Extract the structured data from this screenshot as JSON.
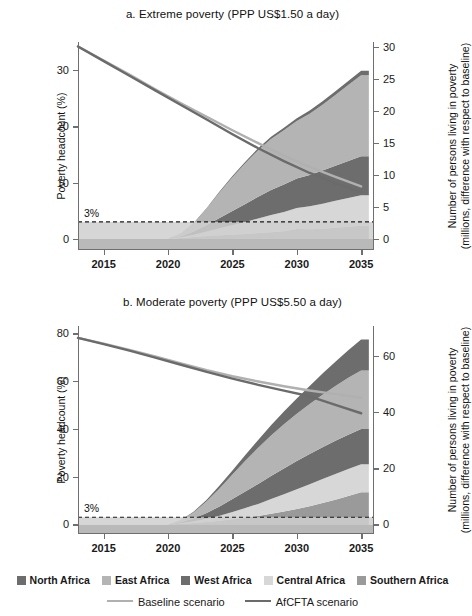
{
  "figure": {
    "threshold_label": "3%"
  },
  "legend": {
    "regions": [
      {
        "label": "North Africa",
        "color": "#6d6d6d"
      },
      {
        "label": "East Africa",
        "color": "#b4b4b4"
      },
      {
        "label": "West Africa",
        "color": "#6d6d6d"
      },
      {
        "label": "Central Africa",
        "color": "#d7d7d7"
      },
      {
        "label": "Southern Africa",
        "color": "#9a9a9a"
      }
    ],
    "lines": [
      {
        "label": "Baseline scenario",
        "color": "#b0b0b0"
      },
      {
        "label": "AfCFTA scenario",
        "color": "#6b6b6b"
      }
    ]
  },
  "chart_data": [
    {
      "id": "panel-a",
      "type": "area",
      "title": "a. Extreme poverty (PPP US$1.50 a day)",
      "xlabel": "",
      "ylabel": "Poverty headcount (%)",
      "y2label": "Number of persons living in poverty (millions, difference with respect to baseline)",
      "y2label_line1": "Number of persons living in poverty",
      "y2label_line2": "(millions, difference with respect to baseline)",
      "xlim": [
        2013,
        2036
      ],
      "ylim": [
        -2,
        35
      ],
      "y2lim": [
        -1.8,
        30.8
      ],
      "xticks": [
        2015,
        2020,
        2025,
        2030,
        2035
      ],
      "yticks": [
        0,
        10,
        20,
        30
      ],
      "y2ticks": [
        0,
        5,
        10,
        15,
        20,
        25,
        30
      ],
      "grid": false,
      "threshold": 3,
      "x": [
        2013,
        2015,
        2017,
        2019,
        2020,
        2021,
        2022,
        2023,
        2024,
        2025,
        2026,
        2027,
        2028,
        2029,
        2030,
        2031,
        2032,
        2033,
        2034,
        2035,
        2035.6
      ],
      "stack_order": [
        "Southern Africa",
        "Central Africa",
        "West Africa",
        "East Africa",
        "North Africa"
      ],
      "series": [
        {
          "name": "Southern Africa",
          "color": "#9a9a9a",
          "values": [
            0,
            0,
            0,
            0,
            0,
            0.1,
            0.25,
            0.4,
            0.5,
            0.6,
            0.7,
            0.85,
            1.0,
            1.15,
            1.5,
            1.45,
            1.55,
            1.7,
            1.85,
            2.0,
            2.0
          ]
        },
        {
          "name": "Central Africa",
          "color": "#d7d7d7",
          "values": [
            0,
            0,
            0,
            0,
            0,
            0.1,
            0.35,
            0.7,
            1.1,
            1.5,
            1.9,
            2.3,
            2.7,
            3.0,
            3.3,
            3.6,
            3.9,
            4.2,
            4.5,
            4.8,
            4.8
          ]
        },
        {
          "name": "West Africa",
          "color": "#6d6d6d",
          "values": [
            0,
            0,
            0,
            0,
            0,
            0.15,
            0.5,
            1.0,
            1.6,
            2.2,
            2.8,
            3.4,
            3.9,
            4.3,
            4.6,
            4.9,
            5.2,
            5.5,
            5.8,
            6.1,
            6.1
          ]
        },
        {
          "name": "East Africa",
          "color": "#b4b4b4",
          "values": [
            0,
            0,
            0,
            0,
            0,
            0.4,
            1.3,
            2.6,
            4.0,
            5.3,
            6.4,
            7.3,
            8.0,
            8.5,
            9.0,
            9.6,
            10.3,
            11.1,
            11.9,
            12.7,
            12.7
          ]
        },
        {
          "name": "North Africa",
          "color": "#6d6d6d",
          "values": [
            0,
            0,
            0,
            0,
            0,
            0.02,
            0.06,
            0.1,
            0.15,
            0.2,
            0.25,
            0.3,
            0.35,
            0.4,
            0.45,
            0.5,
            0.55,
            0.6,
            0.65,
            0.7,
            0.7
          ]
        }
      ],
      "lines": [
        {
          "name": "Baseline scenario",
          "color": "#b0b0b0",
          "x": [
            2013,
            2015,
            2017,
            2019,
            2021,
            2023,
            2025,
            2027,
            2029,
            2031,
            2033,
            2035
          ],
          "y": [
            34.2,
            31.7,
            29.2,
            26.6,
            24.1,
            21.7,
            19.3,
            17.0,
            14.8,
            12.8,
            11.0,
            9.3
          ]
        },
        {
          "name": "AfCFTA scenario",
          "color": "#6b6b6b",
          "x": [
            2013,
            2015,
            2017,
            2019,
            2021,
            2023,
            2025,
            2027,
            2029,
            2031,
            2033,
            2035
          ],
          "y": [
            34.2,
            31.6,
            29.0,
            26.4,
            23.8,
            21.2,
            18.6,
            16.1,
            13.8,
            11.7,
            9.9,
            8.3
          ]
        }
      ]
    },
    {
      "id": "panel-b",
      "type": "area",
      "title": "b. Moderate poverty (PPP US$5.50 a day)",
      "xlabel": "",
      "ylabel": "Poverty headcount (%)",
      "y2label": "Number of persons living in poverty (millions, difference with respect to baseline)",
      "y2label_line1": "Number of persons living in poverty",
      "y2label_line2": "(millions, difference with respect to baseline)",
      "xlim": [
        2013,
        2036
      ],
      "ylim": [
        -4,
        83
      ],
      "y2lim": [
        -3.4,
        70.5
      ],
      "xticks": [
        2015,
        2020,
        2025,
        2030,
        2035
      ],
      "yticks": [
        0,
        20,
        40,
        60,
        80
      ],
      "y2ticks": [
        0,
        20,
        40,
        60
      ],
      "grid": false,
      "threshold": 3,
      "x": [
        2013,
        2015,
        2017,
        2019,
        2020,
        2021,
        2022,
        2023,
        2024,
        2025,
        2026,
        2027,
        2028,
        2029,
        2030,
        2031,
        2032,
        2033,
        2034,
        2035,
        2035.6
      ],
      "stack_order": [
        "Southern Africa",
        "Central Africa",
        "West Africa",
        "East Africa",
        "North Africa"
      ],
      "series": [
        {
          "name": "Southern Africa",
          "color": "#9a9a9a",
          "values": [
            0,
            0,
            0,
            0,
            0,
            0.2,
            0.5,
            0.9,
            1.3,
            1.8,
            2.4,
            3.0,
            3.8,
            4.6,
            5.5,
            6.5,
            7.6,
            8.8,
            10.1,
            11.4,
            11.4
          ]
        },
        {
          "name": "Central Africa",
          "color": "#d7d7d7",
          "values": [
            0,
            0,
            0,
            0,
            0,
            0.2,
            0.6,
            1.1,
            1.8,
            2.6,
            3.4,
            4.3,
            5.2,
            6.1,
            7.0,
            7.8,
            8.5,
            9.1,
            9.6,
            10.0,
            10.0
          ]
        },
        {
          "name": "West Africa",
          "color": "#6d6d6d",
          "values": [
            0,
            0,
            0,
            0,
            0,
            0.4,
            1.1,
            2.1,
            3.3,
            4.6,
            5.9,
            7.1,
            8.2,
            9.2,
            10.0,
            10.7,
            11.3,
            11.8,
            12.2,
            12.5,
            12.5
          ]
        },
        {
          "name": "East Africa",
          "color": "#b4b4b4",
          "values": [
            0,
            0,
            0,
            0,
            0,
            0.7,
            2.1,
            4.1,
            6.4,
            8.7,
            10.9,
            12.8,
            14.4,
            15.7,
            16.8,
            17.8,
            18.7,
            19.5,
            20.2,
            20.8,
            20.8
          ]
        },
        {
          "name": "North Africa",
          "color": "#6d6d6d",
          "values": [
            0,
            0,
            0,
            0,
            0,
            0.1,
            0.3,
            0.6,
            1.0,
            1.5,
            2.1,
            2.8,
            3.6,
            4.5,
            5.4,
            6.4,
            7.5,
            8.6,
            9.8,
            11.0,
            11.0
          ]
        }
      ],
      "lines": [
        {
          "name": "Baseline scenario",
          "color": "#b0b0b0",
          "x": [
            2013,
            2015,
            2017,
            2019,
            2021,
            2023,
            2025,
            2027,
            2029,
            2031,
            2033,
            2035
          ],
          "y": [
            78.0,
            75.6,
            73.0,
            70.3,
            67.4,
            64.5,
            62.0,
            59.8,
            57.8,
            56.0,
            54.5,
            53.0
          ]
        },
        {
          "name": "AfCFTA scenario",
          "color": "#6b6b6b",
          "x": [
            2013,
            2015,
            2017,
            2019,
            2021,
            2023,
            2025,
            2027,
            2029,
            2031,
            2033,
            2035
          ],
          "y": [
            78.0,
            75.4,
            72.7,
            69.8,
            66.8,
            63.8,
            61.0,
            58.4,
            56.0,
            53.6,
            50.0,
            46.5
          ]
        }
      ]
    }
  ]
}
